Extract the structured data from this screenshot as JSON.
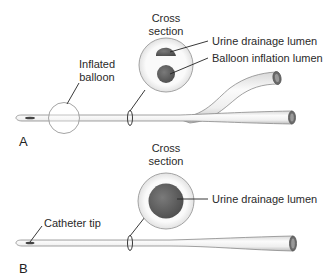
{
  "figure": {
    "panel_a": {
      "letter": "A",
      "cross_section_line1": "Cross",
      "cross_section_line2": "section",
      "label_urine": "Urine drainage lumen",
      "label_balloon_lumen": "Balloon inflation lumen",
      "label_balloon_line1": "Inflated",
      "label_balloon_line2": "balloon"
    },
    "panel_b": {
      "letter": "B",
      "cross_section_line1": "Cross",
      "cross_section_line2": "section",
      "label_urine": "Urine drainage lumen",
      "label_tip": "Catheter tip"
    }
  },
  "colors": {
    "tube_fill": "#f2f2f2",
    "tube_stroke": "#8a8a8a",
    "lumen_dark": "#5a5a5a",
    "leader_line": "#222222"
  }
}
